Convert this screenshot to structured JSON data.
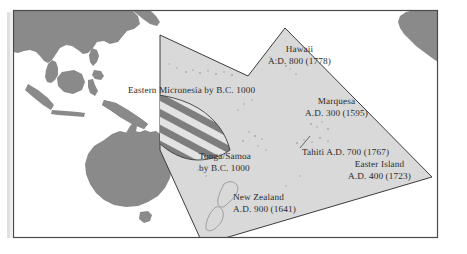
{
  "figure": {
    "name": "polynesian-settlement-map",
    "width": 467,
    "height": 254,
    "background_color": "#ffffff"
  },
  "colors": {
    "ocean": "#ffffff",
    "land": "#8a8a8a",
    "triangle_fill": "#d9d9d9",
    "triangle_stroke": "#3c3c3c",
    "hatch_dark": "#7e7e7e",
    "hatch_light": "#e3e3e3",
    "frame_stroke": "#4a4a4a",
    "label_text": "#2b2b2b",
    "island_speck": "#9a9a9a"
  },
  "frame": {
    "name": "map-frame",
    "left": 13,
    "top": 10,
    "right": 438,
    "bottom": 238
  },
  "labels": [
    {
      "id": "label-hawaii",
      "name": "map-label-hawaii",
      "align": "center",
      "lines": [
        "Hawaii",
        "A.D. 800 (1778)"
      ]
    },
    {
      "id": "label-micronesia",
      "name": "map-label-eastern-micronesia",
      "align": "left",
      "lines": [
        "Eastern Micronesia by B.C. 1000"
      ]
    },
    {
      "id": "label-marquesa",
      "name": "map-label-marquesa",
      "align": "center",
      "lines": [
        "Marquesa",
        "A.D. 300 (1595)"
      ]
    },
    {
      "id": "label-tonga-samoa",
      "name": "map-label-tonga-samoa",
      "align": "left",
      "lines": [
        "Tonga/Samoa",
        "by B.C. 1000"
      ]
    },
    {
      "id": "label-tahiti",
      "name": "map-label-tahiti",
      "align": "left",
      "lines": [
        "Tahiti A.D. 700 (1767)"
      ]
    },
    {
      "id": "label-easter-island",
      "name": "map-label-easter-island",
      "align": "center",
      "lines": [
        "Easter Island",
        "A.D. 400 (1723)"
      ]
    },
    {
      "id": "label-new-zealand",
      "name": "map-label-new-zealand",
      "align": "left",
      "lines": [
        "New Zealand",
        "A.D. 900 (1641)"
      ]
    }
  ],
  "regions": {
    "polynesian_triangle": {
      "name": "polynesian-triangle-region",
      "description": "Polynesian settlement triangle, light gray fill"
    },
    "eastern_micronesia": {
      "name": "eastern-micronesia-region",
      "description": "Diagonally hatched band, Eastern Micronesia"
    }
  },
  "landmasses": [
    {
      "name": "landmass-southeast-asia",
      "label": "Southeast Asia"
    },
    {
      "name": "landmass-indonesia",
      "label": "Indonesia"
    },
    {
      "name": "landmass-philippines",
      "label": "Philippines"
    },
    {
      "name": "landmass-new-guinea",
      "label": "New Guinea"
    },
    {
      "name": "landmass-australia",
      "label": "Australia"
    },
    {
      "name": "landmass-tasmania",
      "label": "Tasmania"
    },
    {
      "name": "landmass-americas",
      "label": "Americas"
    },
    {
      "name": "outline-new-zealand",
      "label": "New Zealand"
    }
  ]
}
